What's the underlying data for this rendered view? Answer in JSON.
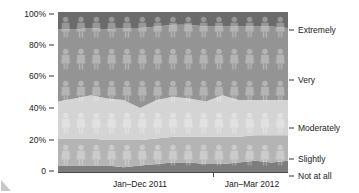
{
  "chart_data": {
    "type": "area",
    "title": "",
    "subtitle": "",
    "xlabel": "",
    "ylabel": "",
    "stacked": true,
    "percent_stacked": true,
    "grid": false,
    "legend_position": "right",
    "ylim": [
      0,
      100
    ],
    "y_ticks": [
      "0",
      "20%",
      "40%",
      "60%",
      "80%",
      "100%"
    ],
    "y_tick_values": [
      0,
      20,
      40,
      60,
      80,
      100
    ],
    "x_group_labels": [
      "Jan–Dec 2011",
      "Jan–Mar 2012"
    ],
    "x_divider_label": "",
    "categories": [
      "Jan 2011",
      "Feb 2011",
      "Mar 2011",
      "Apr 2011",
      "May 2011",
      "Jun 2011",
      "Jul 2011",
      "Aug 2011",
      "Sep 2011",
      "Oct 2011",
      "Nov 2011",
      "Dec 2011",
      "Jan 2012",
      "Feb 2012",
      "Mar 2012"
    ],
    "series": [
      {
        "name": "Not at all",
        "color": "#7d7d7d",
        "values": [
          4,
          4,
          4,
          4,
          3,
          4,
          5,
          6,
          6,
          5,
          5,
          6,
          7,
          6,
          7
        ]
      },
      {
        "name": "Slightly",
        "color": "#b4b4b4",
        "values": [
          17,
          17,
          17,
          16,
          17,
          16,
          16,
          16,
          16,
          17,
          17,
          16,
          16,
          17,
          16
        ]
      },
      {
        "name": "Moderately",
        "color": "#d4d4d4",
        "values": [
          23,
          25,
          27,
          26,
          25,
          20,
          24,
          25,
          24,
          22,
          26,
          23,
          22,
          22,
          22
        ]
      },
      {
        "name": "Very",
        "color": "#949494",
        "values": [
          45,
          43,
          42,
          43,
          45,
          50,
          46,
          45,
          46,
          47,
          43,
          46,
          46,
          46,
          45
        ]
      },
      {
        "name": "Extremely",
        "color": "#6b6b6b",
        "values": [
          11,
          11,
          10,
          11,
          10,
          10,
          9,
          8,
          8,
          9,
          9,
          9,
          9,
          9,
          10
        ]
      }
    ]
  },
  "axis": {
    "y_labels": [
      "100%",
      "80%",
      "60%",
      "40%",
      "20%",
      "0"
    ],
    "x_labels": [
      "Jan–Dec 2011",
      "Jan–Mar 2012"
    ]
  },
  "legend": {
    "items": [
      {
        "label": "Extremely",
        "color": "#6b6b6b"
      },
      {
        "label": "Very",
        "color": "#949494"
      },
      {
        "label": "Moderately",
        "color": "#d4d4d4"
      },
      {
        "label": "Slightly",
        "color": "#b4b4b4"
      },
      {
        "label": "Not at all",
        "color": "#7d7d7d"
      }
    ]
  },
  "watermark": {
    "icon": "person-silhouette",
    "rows": 5,
    "columns": 15
  }
}
